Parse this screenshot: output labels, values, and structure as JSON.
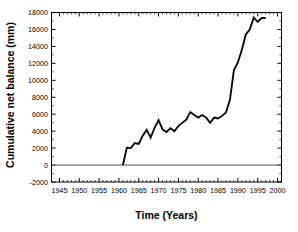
{
  "chart_data": {
    "type": "line",
    "title": "",
    "xlabel": "Time (Years)",
    "ylabel": "Cumulative net balance (mm)",
    "xlim": [
      1943,
      2001
    ],
    "ylim": [
      -2000,
      18000
    ],
    "xticks": [
      1945,
      1950,
      1955,
      1960,
      1965,
      1970,
      1975,
      1980,
      1985,
      1990,
      1995,
      2000
    ],
    "xtick_labels": [
      "1945",
      "1950",
      "1955",
      "1960",
      "1965",
      "1970",
      "1975",
      "1980",
      "1985",
      "1990",
      "1995",
      "2000"
    ],
    "yticks": [
      -2000,
      0,
      2000,
      4000,
      6000,
      8000,
      10000,
      12000,
      14000,
      16000,
      18000
    ],
    "ytick_labels": [
      "-2000",
      "0",
      "2000",
      "4000",
      "6000",
      "8000",
      "10000",
      "12000",
      "14000",
      "16000",
      "18000"
    ],
    "grid": false,
    "legend": null,
    "minor_ticks": true,
    "tick_direction": "in",
    "line_color": "#000000",
    "line_width": 1.8,
    "zero_line": {
      "y": 0,
      "color": "#555555",
      "width": 1.0
    },
    "series": [
      {
        "name": "Cumulative net balance",
        "x": [
          1961,
          1962,
          1963,
          1964,
          1965,
          1966,
          1967,
          1968,
          1969,
          1970,
          1971,
          1972,
          1973,
          1974,
          1975,
          1976,
          1977,
          1978,
          1979,
          1980,
          1981,
          1982,
          1983,
          1984,
          1985,
          1986,
          1987,
          1988,
          1989,
          1990,
          1991,
          1992,
          1993,
          1994,
          1995,
          1996,
          1997
        ],
        "y": [
          0,
          2050,
          2000,
          2600,
          2500,
          3450,
          4150,
          3250,
          4400,
          5300,
          4200,
          3900,
          4350,
          4000,
          4600,
          5000,
          5350,
          6250,
          5900,
          5600,
          5900,
          5600,
          5000,
          5600,
          5500,
          5800,
          6200,
          6000,
          6350,
          6400,
          6200,
          6000,
          6100,
          6200,
          6100,
          6400,
          6500
        ],
        "y_full": [
          0,
          2050,
          2000,
          2600,
          2500,
          3450,
          4150,
          3250,
          4400,
          5300,
          4200,
          3900,
          4350,
          4000,
          4600,
          5000,
          5350,
          6250,
          5900,
          5600,
          5900,
          5600,
          5000,
          5600,
          5500,
          5800,
          6200,
          7700,
          11200,
          12100,
          13600,
          15400,
          16000,
          17400,
          16900,
          17350,
          17350
        ]
      }
    ],
    "data_points": [
      {
        "year": 1961,
        "value": 0
      },
      {
        "year": 1962,
        "value": 2050
      },
      {
        "year": 1963,
        "value": 2000
      },
      {
        "year": 1964,
        "value": 2600
      },
      {
        "year": 1965,
        "value": 2500
      },
      {
        "year": 1966,
        "value": 3450
      },
      {
        "year": 1967,
        "value": 4150
      },
      {
        "year": 1968,
        "value": 3250
      },
      {
        "year": 1969,
        "value": 4400
      },
      {
        "year": 1970,
        "value": 5300
      },
      {
        "year": 1971,
        "value": 4200
      },
      {
        "year": 1972,
        "value": 3900
      },
      {
        "year": 1973,
        "value": 4350
      },
      {
        "year": 1974,
        "value": 4000
      },
      {
        "year": 1975,
        "value": 4600
      },
      {
        "year": 1976,
        "value": 5000
      },
      {
        "year": 1977,
        "value": 5350
      },
      {
        "year": 1978,
        "value": 6250
      },
      {
        "year": 1979,
        "value": 5900
      },
      {
        "year": 1980,
        "value": 5600
      },
      {
        "year": 1981,
        "value": 5900
      },
      {
        "year": 1982,
        "value": 5600
      },
      {
        "year": 1983,
        "value": 5000
      },
      {
        "year": 1984,
        "value": 5600
      },
      {
        "year": 1985,
        "value": 5500
      },
      {
        "year": 1986,
        "value": 5800
      },
      {
        "year": 1987,
        "value": 6200
      },
      {
        "year": 1988,
        "value": 7700
      },
      {
        "year": 1989,
        "value": 11200
      },
      {
        "year": 1990,
        "value": 12100
      },
      {
        "year": 1991,
        "value": 13600
      },
      {
        "year": 1992,
        "value": 15400
      },
      {
        "year": 1993,
        "value": 16000
      },
      {
        "year": 1994,
        "value": 17400
      },
      {
        "year": 1995,
        "value": 16900
      },
      {
        "year": 1996,
        "value": 17350
      },
      {
        "year": 1997,
        "value": 17350
      }
    ]
  }
}
